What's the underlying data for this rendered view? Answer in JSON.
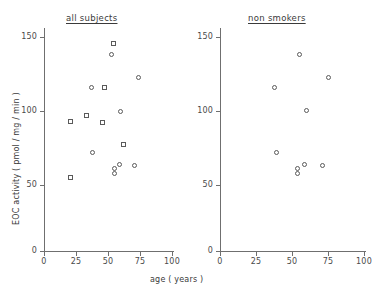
{
  "figure": {
    "axis_title_x": "age ( years )",
    "axis_title_y": "EOC  activity  ( pmol / mg / min )",
    "marker_color": "#5a5a5a",
    "axis_color": "#6f6f6f"
  },
  "panels": [
    {
      "id": "all-subjects",
      "title": "all subjects",
      "x_ticks": [
        "0",
        "25",
        "50",
        "75",
        "100"
      ],
      "y_ticks": [
        "0",
        "50",
        "100",
        "150"
      ]
    },
    {
      "id": "non-smokers",
      "title": "non smokers",
      "x_ticks": [
        "0",
        "25",
        "50",
        "75",
        "100"
      ],
      "y_ticks": [
        "0",
        "50",
        "100",
        "150"
      ]
    }
  ],
  "chart_data": {
    "type": "scatter",
    "title": "",
    "xlabel": "age ( years )",
    "ylabel": "EOC activity ( pmol / mg / min )",
    "xlim": [
      0,
      100
    ],
    "ylim": [
      0,
      160
    ],
    "grid": false,
    "legend": "none",
    "panels": [
      {
        "name": "all subjects",
        "series": [
          {
            "name": "smokers",
            "marker": "square",
            "points": [
              {
                "x": 21,
                "y": 97
              },
              {
                "x": 21,
                "y": 55
              },
              {
                "x": 33,
                "y": 101
              },
              {
                "x": 46,
                "y": 96
              },
              {
                "x": 47,
                "y": 122
              },
              {
                "x": 54,
                "y": 155
              },
              {
                "x": 62,
                "y": 80
              }
            ]
          },
          {
            "name": "non smokers",
            "marker": "circle",
            "points": [
              {
                "x": 37,
                "y": 122
              },
              {
                "x": 38,
                "y": 74
              },
              {
                "x": 53,
                "y": 147
              },
              {
                "x": 55,
                "y": 62
              },
              {
                "x": 55,
                "y": 58
              },
              {
                "x": 59,
                "y": 65
              },
              {
                "x": 60,
                "y": 104
              },
              {
                "x": 71,
                "y": 64
              },
              {
                "x": 74,
                "y": 130
              }
            ]
          }
        ]
      },
      {
        "name": "non smokers",
        "series": [
          {
            "name": "non smokers",
            "marker": "circle",
            "points": [
              {
                "x": 38,
                "y": 122
              },
              {
                "x": 39,
                "y": 74
              },
              {
                "x": 55,
                "y": 147
              },
              {
                "x": 54,
                "y": 62
              },
              {
                "x": 54,
                "y": 58
              },
              {
                "x": 59,
                "y": 65
              },
              {
                "x": 60,
                "y": 105
              },
              {
                "x": 71,
                "y": 64
              },
              {
                "x": 75,
                "y": 130
              }
            ]
          }
        ]
      }
    ]
  }
}
